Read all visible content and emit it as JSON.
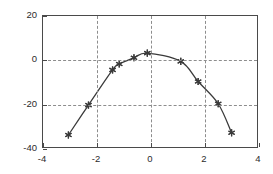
{
  "chart_data": {
    "type": "line",
    "title": "",
    "xlabel": "",
    "ylabel": "",
    "xlim": [
      -4,
      4
    ],
    "ylim": [
      -40,
      20
    ],
    "xticks": [
      -4,
      -2,
      0,
      2,
      4
    ],
    "yticks": [
      -40,
      -20,
      0,
      20
    ],
    "xtick_labels": [
      "-4",
      "-2",
      "0",
      "2",
      "4"
    ],
    "ytick_labels": [
      "-40",
      "-20",
      "0",
      "20"
    ],
    "grid": true,
    "legend": null,
    "series": [
      {
        "name": "data",
        "marker": "star-asterisk",
        "line_style": "solid",
        "color": "#3a3a3a",
        "x": [
          -3.05,
          -2.3,
          -1.4,
          -1.15,
          -0.6,
          -0.1,
          1.15,
          1.8,
          2.55,
          3.05
        ],
        "y": [
          -34.5,
          -20.8,
          -4.7,
          -2.0,
          0.9,
          3.0,
          -0.8,
          -10.0,
          -20.2,
          -33.5
        ]
      }
    ]
  },
  "axes": {
    "frame_color": "#4a4a4a",
    "grid_color": "#8d8d8d",
    "background": "#ffffff"
  }
}
